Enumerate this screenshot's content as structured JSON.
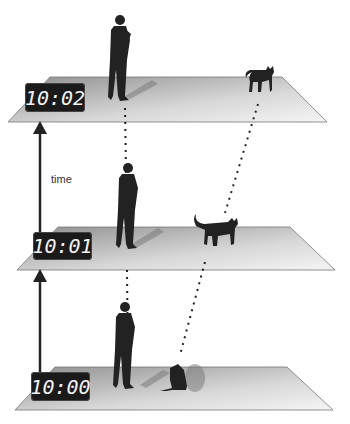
{
  "diagram": {
    "axis_label": "time",
    "frames": [
      {
        "time": "10:02",
        "person": "standing-man",
        "cat": "walking-cat"
      },
      {
        "time": "10:01",
        "person": "standing-man",
        "cat": "walking-cat"
      },
      {
        "time": "10:00",
        "person": "standing-man",
        "cat": "sitting-cat"
      }
    ],
    "colors": {
      "plane_light": "#f4f4f4",
      "plane_dark": "#9a9a9a",
      "silhouette": "#222222",
      "clock_bg": "#1a1a1a"
    }
  }
}
